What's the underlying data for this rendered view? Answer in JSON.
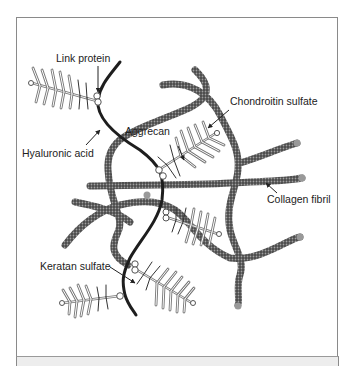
{
  "figure": {
    "labels": {
      "link_protein": "Link protein",
      "hyaluronic_acid": "Hyaluronic acid",
      "aggrecan": "Aggrecan",
      "chondroitin_sulfate": "Chondroitin sulfate",
      "collagen_fibril": "Collagen fibril",
      "keratan_sulfate": "Keratan sulfate"
    },
    "colors": {
      "collagen_fill": "#555555",
      "collagen_texture": "#9a9a9a",
      "hyaluronic_acid": "#1e1e1e",
      "proteoglycan_bristle": "#8c8c8c",
      "frame_border": "#8a8a8a",
      "footer_band": "#ededed"
    }
  }
}
